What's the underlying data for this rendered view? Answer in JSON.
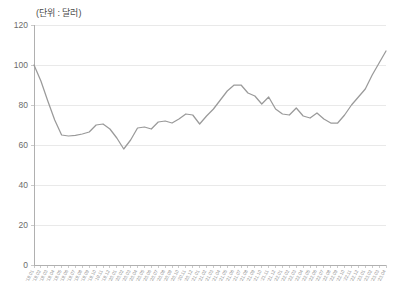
{
  "chart_data": {
    "type": "line",
    "title": "(단위 : 달러)",
    "xlabel": "",
    "ylabel": "",
    "ylim": [
      0,
      120
    ],
    "yticks": [
      0,
      20,
      40,
      60,
      80,
      100,
      120
    ],
    "grid": true,
    "legend": false,
    "series_color": "#9a9a9a",
    "grid_color": "#e9e9e9",
    "axis_color": "#b0b0b0",
    "categories": [
      "'19.01",
      "'19.02",
      "'19.03",
      "'19.04",
      "'19.05",
      "'19.06",
      "'19.07",
      "'19.08",
      "'19.09",
      "'19.10",
      "'19.11",
      "'19.12",
      "'20.01",
      "'20.02",
      "'20.03",
      "'20.04",
      "'20.05",
      "'20.06",
      "'20.07",
      "'20.08",
      "'20.09",
      "'20.10",
      "'20.11",
      "'20.12",
      "'21.01",
      "'21.02",
      "'21.03",
      "'21.04",
      "'21.05",
      "'21.06",
      "'21.07",
      "'21.08",
      "'21.09",
      "'21.10",
      "'21.11",
      "'21.12",
      "'22.01",
      "'22.02",
      "'22.03",
      "'22.04",
      "'22.05",
      "'22.06",
      "'22.07",
      "'22.08",
      "'22.09",
      "'22.10",
      "'22.11",
      "'22.12",
      "'23.01",
      "'23.02",
      "'23.03",
      "'23.04"
    ],
    "values": [
      100.0,
      92.0,
      82.0,
      72.5,
      65.0,
      64.5,
      64.8,
      65.5,
      66.5,
      70.0,
      70.5,
      68.0,
      63.5,
      58.0,
      62.5,
      68.5,
      69.0,
      68.0,
      71.5,
      72.0,
      71.0,
      73.0,
      75.5,
      75.0,
      70.5,
      74.5,
      78.0,
      82.5,
      87.0,
      90.0,
      90.0,
      86.0,
      84.5,
      80.5,
      84.0,
      78.0,
      75.5,
      75.0,
      78.5,
      74.5,
      73.5,
      76.0,
      73.0,
      71.0,
      71.0,
      75.0,
      80.0,
      84.0,
      88.0,
      95.0,
      101.0,
      107.0
    ],
    "xtick_labels_shown": [
      "'19.01",
      "'19.02",
      "'19.03",
      "'19.04",
      "'19.05",
      "'19.06",
      "'19.07",
      "'19.08",
      "'19.09",
      "'19.10",
      "'19.11",
      "'19.12",
      "'20.01",
      "'20.02",
      "'20.03",
      "'20.04",
      "'20.05",
      "'20.06",
      "'20.07",
      "'20.08",
      "'20.09",
      "'20.10",
      "'20.11",
      "'20.12",
      "'21.01",
      "'21.02",
      "'21.03",
      "'21.04",
      "'21.05",
      "'21.06",
      "'21.07",
      "'21.08",
      "'21.09",
      "'21.10",
      "'21.11",
      "'21.12",
      "'22.01",
      "'22.02",
      "'22.03",
      "'22.04",
      "'22.05",
      "'22.06",
      "'22.07",
      "'22.08",
      "'22.09",
      "'22.10",
      "'22.11",
      "'22.12",
      "'23.01",
      "'23.02",
      "'23.03",
      "'23.04"
    ]
  }
}
